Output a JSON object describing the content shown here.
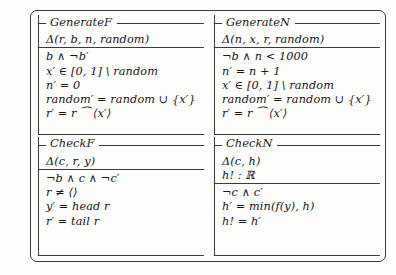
{
  "figure": {
    "caption_present": false,
    "colors": {
      "background": "#fdfdfb",
      "rule": "#3a3a3a",
      "text": "#16161a"
    }
  },
  "schemas": [
    {
      "name": "GenerateF",
      "declarations": [
        "Δ(r, b, n, random)"
      ],
      "predicates": [
        "b ∧ ¬b′",
        "x′ ∈ [0, 1] \\ random",
        "n′ = 0",
        "random′ = random ∪ {x′}",
        "r′ = r ⁀ ⟨x′⟩"
      ]
    },
    {
      "name": "GenerateN",
      "declarations": [
        "Δ(n, x, r, random)"
      ],
      "predicates": [
        "¬b ∧ n < 1000",
        "n′ = n + 1",
        "x′ ∈ [0, 1] \\ random",
        "random′ = random ∪ {x′}",
        "r′ = r ⁀ ⟨x′⟩"
      ]
    },
    {
      "name": "CheckF",
      "declarations": [
        "Δ(c, r, y)"
      ],
      "predicates": [
        "¬b ∧ c ∧ ¬c′",
        "r ≠ ⟨⟩",
        "y′ = head r",
        "r′ = tail r"
      ]
    },
    {
      "name": "CheckN",
      "declarations": [
        "Δ(c, h)",
        "h! : ℝ"
      ],
      "predicates": [
        "¬c ∧ c′",
        "h′ = min(f(y), h)",
        "h! = h′"
      ]
    }
  ]
}
